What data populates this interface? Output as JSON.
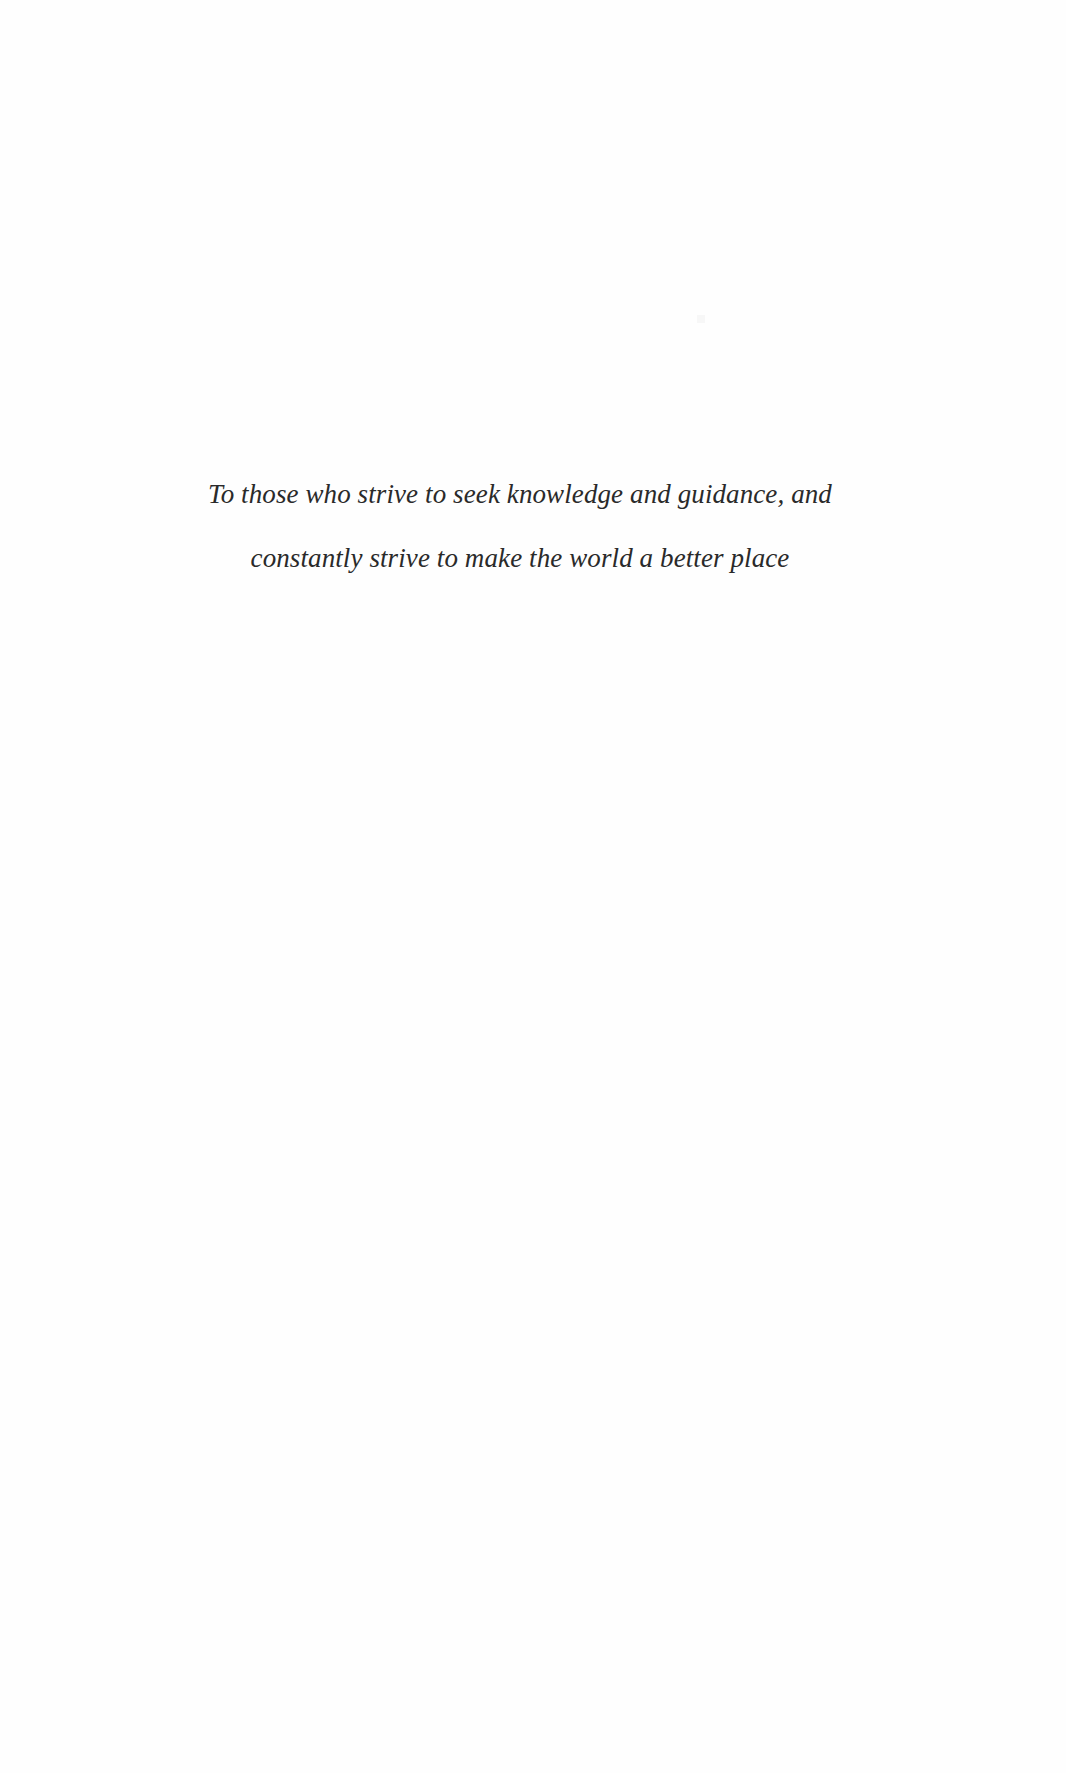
{
  "page": {
    "type": "dedication",
    "background_color": "#fefefe",
    "text_color": "#2a2a2a"
  },
  "dedication": {
    "lines": [
      "To those who strive to seek knowledge and guidance, and",
      "constantly strive to make the world a better place"
    ]
  }
}
